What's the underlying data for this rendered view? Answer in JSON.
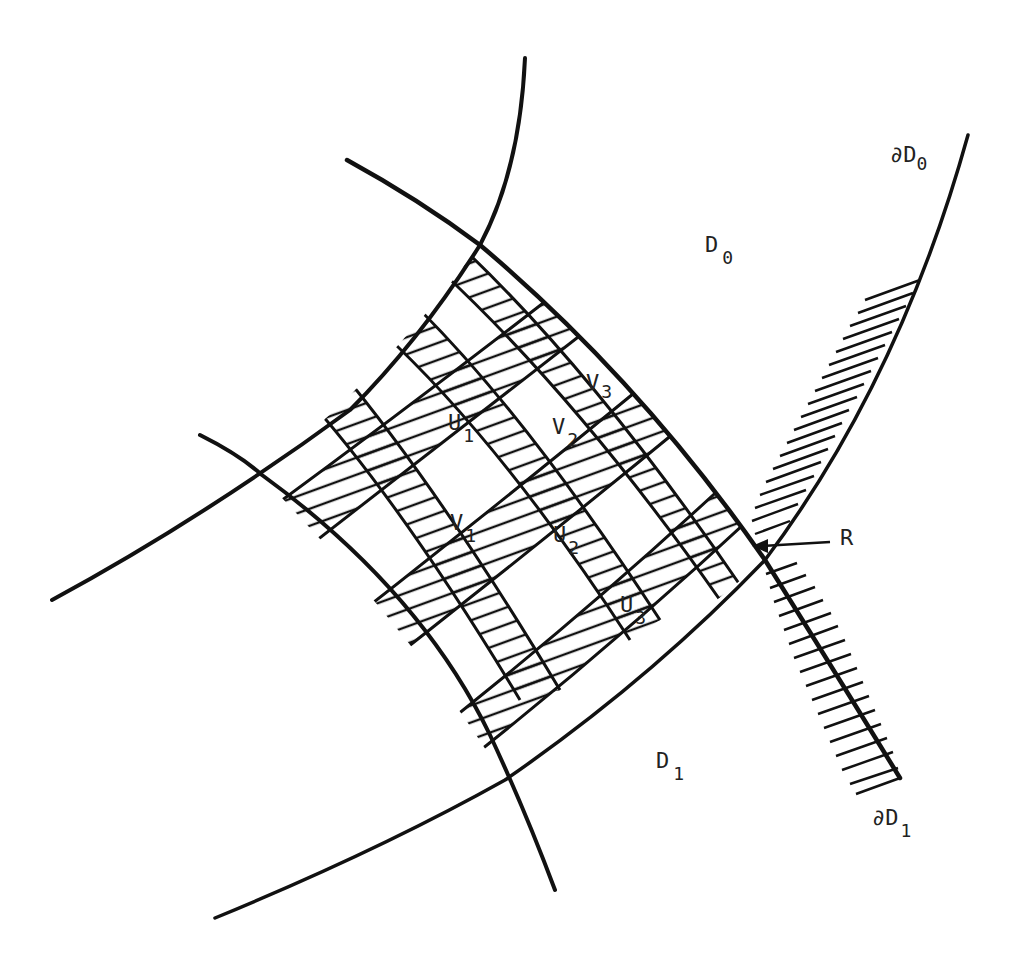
{
  "figure": {
    "type": "mathematical-diagram",
    "colors": {
      "ink": "#111111",
      "background": "#ffffff"
    }
  },
  "labels": {
    "dD0": {
      "prefix": "∂D",
      "sub": "0"
    },
    "D0": {
      "main": "D",
      "sub": "0"
    },
    "D1": {
      "main": "D",
      "sub": "1"
    },
    "dD1": {
      "prefix": "∂D",
      "sub": "1"
    },
    "R": {
      "main": "R"
    },
    "U1": {
      "main": "U",
      "sub": "1"
    },
    "U2": {
      "main": "U",
      "sub": "2"
    },
    "U3": {
      "main": "U",
      "sub": "3"
    },
    "V1": {
      "main": "V",
      "sub": "1"
    },
    "V2": {
      "main": "V",
      "sub": "2"
    },
    "V3": {
      "main": "V",
      "sub": "3"
    }
  },
  "strips": {
    "horizontal": [
      "U1",
      "U2",
      "U3"
    ],
    "vertical": [
      "V1",
      "V2",
      "V3"
    ]
  },
  "annotation": {
    "arrow_target": "R"
  }
}
